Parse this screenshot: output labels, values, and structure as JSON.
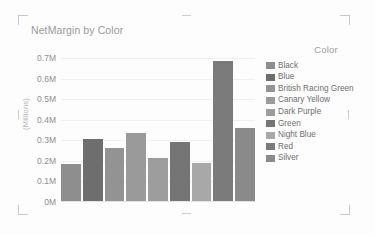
{
  "chart_data": {
    "type": "bar",
    "title": "NetMargin by Color",
    "xlabel": "",
    "ylabel": "(Millions)",
    "categories": [
      "Black",
      "Blue",
      "British Racing Green",
      "Canary Yellow",
      "Dark Purple",
      "Green",
      "Night Blue",
      "Red",
      "Silver"
    ],
    "values": [
      0.18,
      0.3,
      0.26,
      0.33,
      0.21,
      0.285,
      0.185,
      0.68,
      0.355
    ],
    "value_unit": "M",
    "ylim": [
      0,
      0.7
    ],
    "yticks": [
      "0.7M",
      "0.6M",
      "0.5M",
      "0.4M",
      "0.3M",
      "0.2M",
      "0.1M",
      "0M"
    ],
    "ytick_values": [
      0.7,
      0.6,
      0.5,
      0.4,
      0.3,
      0.2,
      0.1,
      0
    ],
    "grid": true,
    "legend_position": "right",
    "legend_title": "Color",
    "series_colors": [
      "#8e8e8e",
      "#6e6e6e",
      "#939393",
      "#9a9a9a",
      "#9d9d9d",
      "#757575",
      "#a8a8a8",
      "#7b7b7b",
      "#8a8a8a"
    ]
  },
  "legend": {
    "title": "Color",
    "items": [
      {
        "label": "Black",
        "color": "#8e8e8e"
      },
      {
        "label": "Blue",
        "color": "#6e6e6e"
      },
      {
        "label": "British Racing Green",
        "color": "#939393"
      },
      {
        "label": "Canary Yellow",
        "color": "#9a9a9a"
      },
      {
        "label": "Dark Purple",
        "color": "#9d9d9d"
      },
      {
        "label": "Green",
        "color": "#757575"
      },
      {
        "label": "Night Blue",
        "color": "#a8a8a8"
      },
      {
        "label": "Red",
        "color": "#7b7b7b"
      },
      {
        "label": "Silver",
        "color": "#8a8a8a"
      }
    ]
  }
}
